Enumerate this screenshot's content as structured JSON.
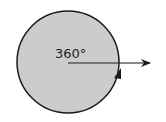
{
  "diagram": {
    "angle_label": "360°",
    "colors": {
      "circle_fill": "#cccccc",
      "stroke": "#1a1a1a",
      "label": "#222222"
    }
  }
}
